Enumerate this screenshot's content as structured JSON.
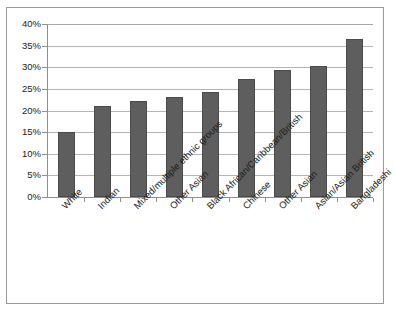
{
  "chart_data": {
    "type": "bar",
    "title": "",
    "subtitle": "",
    "xlabel": "",
    "ylabel": "",
    "ylim": [
      0,
      40
    ],
    "ytick_labels": [
      "40%",
      "35%",
      "30%",
      "25%",
      "20%",
      "15%",
      "10%",
      "5%",
      "0%"
    ],
    "ytick_values": [
      40,
      35,
      30,
      25,
      20,
      15,
      10,
      5,
      0
    ],
    "grid": true,
    "legend": "none",
    "bar_color": "#5e5e5e",
    "categories": [
      "White",
      "Indian",
      "Mixed/multiple ethnic groups",
      "Other Asian",
      "Black African/Caribbean/British",
      "Chinese",
      "Other Asian",
      "Asian/Asian British",
      "Bangladeshi"
    ],
    "values": [
      15.0,
      21.1,
      22.2,
      23.2,
      24.2,
      27.3,
      29.3,
      30.3,
      36.5
    ],
    "value_labels": [
      "15%",
      "21%",
      "22%",
      "23%",
      "24%",
      "27%",
      "29%",
      "30%",
      "37%"
    ]
  }
}
